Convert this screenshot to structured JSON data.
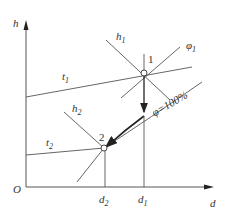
{
  "diagram": {
    "type": "h-d psychrometric chart",
    "axes": {
      "y_label": "h",
      "x_label": "d",
      "origin_label": "O"
    },
    "points": [
      {
        "id": "1",
        "label": "1",
        "d_label": "d",
        "d_sub": "1"
      },
      {
        "id": "2",
        "label": "2",
        "d_label": "d",
        "d_sub": "2"
      }
    ],
    "lines": {
      "t1": {
        "label": "t",
        "sub": "1"
      },
      "t2": {
        "label": "t",
        "sub": "2"
      },
      "h1": {
        "label": "h",
        "sub": "1"
      },
      "h2": {
        "label": "h",
        "sub": "2"
      },
      "phi1": {
        "label": "φ",
        "sub": "1"
      },
      "saturation": {
        "label": "φ=100%"
      }
    },
    "process": {
      "from": "1",
      "to": "2",
      "description": "cooling & dehumidification along saturation line"
    },
    "colors": {
      "line": "#555555",
      "text": "#333333",
      "process": "#222222"
    }
  }
}
